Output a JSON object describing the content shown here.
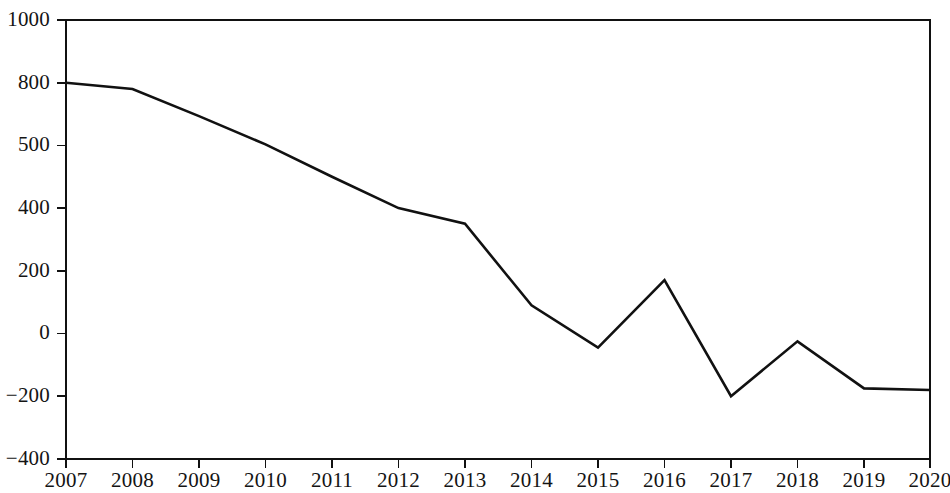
{
  "chart_data": {
    "type": "line",
    "title": "",
    "subtitle": "",
    "xlabel": "",
    "ylabel": "",
    "grid": false,
    "legend": null,
    "x": [
      2007,
      2008,
      2009,
      2010,
      2011,
      2012,
      2013,
      2014,
      2015,
      2016,
      2017,
      2018,
      2019,
      2020
    ],
    "categories": [
      "2007",
      "2008",
      "2009",
      "2010",
      "2011",
      "2012",
      "2013",
      "2014",
      "2015",
      "2016",
      "2017",
      "2018",
      "2019",
      "2020"
    ],
    "values": [
      800,
      770,
      640,
      505,
      450,
      400,
      350,
      90,
      -45,
      170,
      -200,
      -25,
      -175,
      -180
    ],
    "series": [
      {
        "name": "series-1",
        "color": "#111111",
        "values": [
          800,
          770,
          640,
          505,
          450,
          400,
          350,
          90,
          -45,
          170,
          -200,
          -25,
          -175,
          -180
        ]
      }
    ],
    "x_tick_labels": [
      "2007",
      "2008",
      "2009",
      "2010",
      "2011",
      "2012",
      "2013",
      "2014",
      "2015",
      "2016",
      "2017",
      "2018",
      "2019",
      "2020"
    ],
    "y_tick_labels": [
      "1000",
      "800",
      "500",
      "400",
      "200",
      "0",
      "-200",
      "-400"
    ],
    "y_tick_values": [
      1000,
      800,
      500,
      400,
      200,
      0,
      -200,
      -400
    ],
    "y_axis_spacing": "categorical-equal-spacing",
    "ylim": [
      -400,
      1000
    ],
    "xlim": [
      2007,
      2020
    ],
    "line_color": "#111111",
    "axis_color": "#111111",
    "background_color": "#ffffff"
  },
  "axes": {
    "y_ticks": [
      {
        "label": "1000",
        "value": 1000
      },
      {
        "label": "800",
        "value": 800
      },
      {
        "label": "500",
        "value": 500
      },
      {
        "label": "400",
        "value": 400
      },
      {
        "label": "200",
        "value": 200
      },
      {
        "label": "0",
        "value": 0
      },
      {
        "label": "-200",
        "value": -200
      },
      {
        "label": "-400",
        "value": -400
      }
    ],
    "x_ticks": [
      {
        "label": "2007"
      },
      {
        "label": "2008"
      },
      {
        "label": "2009"
      },
      {
        "label": "2010"
      },
      {
        "label": "2011"
      },
      {
        "label": "2012"
      },
      {
        "label": "2013"
      },
      {
        "label": "2014"
      },
      {
        "label": "2015"
      },
      {
        "label": "2016"
      },
      {
        "label": "2017"
      },
      {
        "label": "2018"
      },
      {
        "label": "2019"
      },
      {
        "label": "2020"
      }
    ]
  },
  "geometry": {
    "plot_left": 66,
    "plot_right": 930,
    "plot_top": 20,
    "plot_bottom": 459,
    "y_tick_pixels": [
      20,
      82.7,
      145.4,
      208.1,
      270.8,
      333.5,
      396.2,
      459
    ],
    "x_tick_pixels": [
      66,
      132.5,
      199,
      265.5,
      332,
      398.5,
      465,
      531.5,
      598,
      664.5,
      731,
      797.5,
      864,
      930
    ],
    "point_pixels_y": [
      82.7,
      92.5,
      120.0,
      143.5,
      175.0,
      198.0,
      222.0,
      305.0,
      348.0,
      282.0,
      399.0,
      344.0,
      391.0,
      392.0
    ]
  }
}
